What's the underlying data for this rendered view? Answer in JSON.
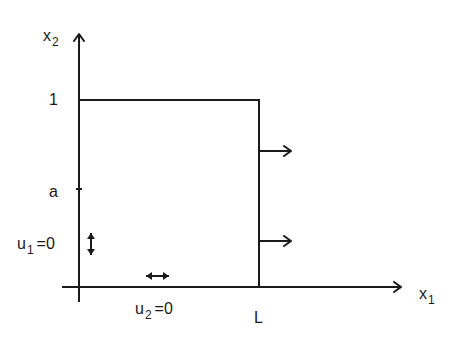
{
  "diagram": {
    "type": "domain-boundary-conditions",
    "stroke_color": "#1a1a1a",
    "axes": {
      "x_label": {
        "base": "x",
        "sub": "1"
      },
      "y_label": {
        "base": "x",
        "sub": "2"
      }
    },
    "ticks": {
      "y_top": "1",
      "y_mid": "a",
      "x_right": "L"
    },
    "boundary_conditions": {
      "left": {
        "base": "u",
        "sub": "1",
        "rest": "=0"
      },
      "bottom": {
        "base": "u",
        "sub": "2",
        "rest": "=0"
      }
    },
    "right_edge_arrows": 2
  }
}
